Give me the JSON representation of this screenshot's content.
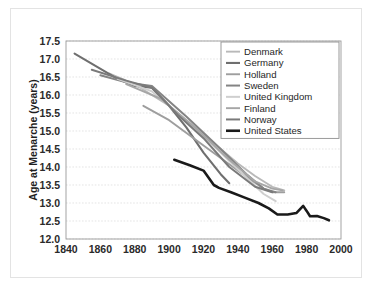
{
  "chart_data": {
    "type": "line",
    "title": "",
    "xlabel": "",
    "ylabel": "Age at Menarche (years)",
    "xlim": [
      1840,
      2000
    ],
    "ylim": [
      12.0,
      17.5
    ],
    "xticks": [
      1840,
      1860,
      1880,
      1900,
      1920,
      1940,
      1960,
      1980,
      2000
    ],
    "yticks": [
      12.0,
      12.5,
      13.0,
      13.5,
      14.0,
      14.5,
      15.0,
      15.5,
      16.0,
      16.5,
      17.0,
      17.5
    ],
    "xtick_labels": [
      "1840",
      "1860",
      "1880",
      "1900",
      "1920",
      "1940",
      "1960",
      "1980",
      "2000"
    ],
    "ytick_labels": [
      "12.0",
      "12.5",
      "13.0",
      "13.5",
      "14.0",
      "14.5",
      "15.0",
      "15.5",
      "16.0",
      "16.5",
      "17.0",
      "17.5"
    ],
    "grid": true,
    "grid_axis": "y",
    "legend_position": "upper right",
    "series": [
      {
        "name": "Denmark",
        "color": "#b9b9b9",
        "width": 1.9,
        "x": [
          1865,
          1880,
          1900,
          1920,
          1940,
          1950,
          1960,
          1967
        ],
        "y": [
          16.6,
          16.3,
          15.7,
          14.9,
          14.1,
          13.75,
          13.45,
          13.35
        ]
      },
      {
        "name": "Germany",
        "color": "#6f6f6f",
        "width": 2.1,
        "x": [
          1845,
          1870,
          1880,
          1890,
          1900,
          1910,
          1920,
          1930,
          1935
        ],
        "y": [
          17.15,
          16.45,
          16.25,
          16.2,
          15.7,
          15.1,
          14.4,
          13.8,
          13.55
        ]
      },
      {
        "name": "Holland",
        "color": "#9e9e9e",
        "width": 1.9,
        "x": [
          1885,
          1900,
          1920,
          1940,
          1955,
          1960,
          1967
        ],
        "y": [
          15.7,
          15.3,
          14.6,
          13.9,
          13.4,
          13.3,
          13.3
        ]
      },
      {
        "name": "Sweden",
        "color": "#848484",
        "width": 2.0,
        "x": [
          1860,
          1875,
          1890,
          1910,
          1930,
          1945,
          1955,
          1962
        ],
        "y": [
          16.55,
          16.35,
          16.25,
          15.4,
          14.5,
          13.8,
          13.4,
          13.3
        ]
      },
      {
        "name": "United Kingdom",
        "color": "#cfcfcf",
        "width": 2.0,
        "x": [
          1870,
          1890,
          1910,
          1930,
          1945,
          1955,
          1962
        ],
        "y": [
          16.45,
          16.1,
          15.3,
          14.4,
          13.7,
          13.25,
          13.05
        ]
      },
      {
        "name": "Finland",
        "color": "#a6a6a6",
        "width": 1.9,
        "x": [
          1875,
          1895,
          1915,
          1935,
          1950,
          1960,
          1966
        ],
        "y": [
          16.3,
          15.9,
          15.1,
          14.2,
          13.6,
          13.4,
          13.35
        ]
      },
      {
        "name": "Norway",
        "color": "#7a7a7a",
        "width": 2.0,
        "x": [
          1855,
          1875,
          1890,
          1905,
          1920,
          1935,
          1950,
          1960
        ],
        "y": [
          16.7,
          16.4,
          16.2,
          15.45,
          14.8,
          14.0,
          13.45,
          13.3
        ]
      },
      {
        "name": "United States",
        "color": "#1a1a1a",
        "width": 2.6,
        "x": [
          1903,
          1912,
          1920,
          1926,
          1929,
          1936,
          1944,
          1952,
          1958,
          1963,
          1969,
          1974,
          1978,
          1980,
          1982,
          1986,
          1990,
          1993
        ],
        "y": [
          14.2,
          14.05,
          13.9,
          13.5,
          13.42,
          13.3,
          13.15,
          13.0,
          12.85,
          12.68,
          12.68,
          12.72,
          12.92,
          12.78,
          12.63,
          12.64,
          12.58,
          12.52
        ]
      }
    ]
  },
  "legend": {
    "entries": [
      {
        "label": "Denmark"
      },
      {
        "label": "Germany"
      },
      {
        "label": "Holland"
      },
      {
        "label": "Sweden"
      },
      {
        "label": "United Kingdom"
      },
      {
        "label": "Finland"
      },
      {
        "label": "Norway"
      },
      {
        "label": "United States"
      }
    ]
  }
}
